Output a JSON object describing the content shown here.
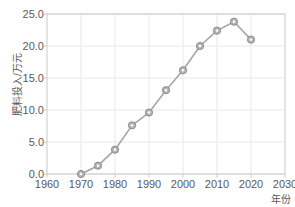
{
  "chart_data": {
    "type": "line",
    "title": "",
    "subtitle": "",
    "xlabel": "年份",
    "ylabel": "肥料投入/万元",
    "xlim": [
      1960,
      2030
    ],
    "ylim": [
      0.0,
      25.0
    ],
    "xticks": [
      "1960",
      "1970",
      "1980",
      "1990",
      "2000",
      "2010",
      "2020",
      "2030"
    ],
    "xtick_values": [
      1960,
      1970,
      1980,
      1990,
      2000,
      2010,
      2020,
      2030
    ],
    "yticks": [
      "0.0",
      "5.0",
      "10.0",
      "15.0",
      "20.0",
      "25.0"
    ],
    "ytick_values": [
      0.0,
      5.0,
      10.0,
      15.0,
      20.0,
      25.0
    ],
    "grid": true,
    "legend": false,
    "legend_position": "none",
    "marker": "circle",
    "line_color": "#a6a6a6",
    "marker_fill": "#b5b5b5",
    "marker_edge": "#8c8c8c",
    "grid_color": "#e8e8e8",
    "axis_color": "#c9c9c9",
    "text_color": "#59595c",
    "x": [
      1970,
      1975,
      1980,
      1985,
      1990,
      1995,
      2000,
      2005,
      2010,
      2015,
      2020
    ],
    "values": [
      0.0,
      1.3,
      3.8,
      7.6,
      9.6,
      13.1,
      16.2,
      20.0,
      22.4,
      23.8,
      21.0
    ],
    "series": [
      {
        "name": "肥料投入",
        "x": [
          1970,
          1975,
          1980,
          1985,
          1990,
          1995,
          2000,
          2005,
          2010,
          2015,
          2020
        ],
        "values": [
          0.0,
          1.3,
          3.8,
          7.6,
          9.6,
          13.1,
          16.2,
          20.0,
          22.4,
          23.8,
          21.0
        ]
      }
    ]
  }
}
